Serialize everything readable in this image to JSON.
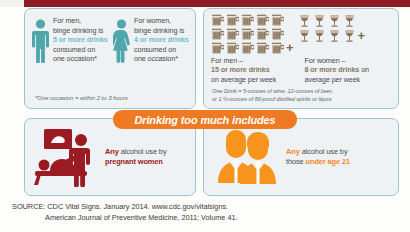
{
  "top_bar": {
    "color": "#8e1c24"
  },
  "binge_panel": {
    "men": {
      "icon": "male-figure-icon",
      "line1": "For men,",
      "line2": "binge drinking is",
      "highlight": "5 or more drinks",
      "line3": "consumed on",
      "line4": "one occasion*"
    },
    "women": {
      "icon": "female-figure-icon",
      "line1": "For women,",
      "line2": "binge drinking is",
      "highlight": "4 or more drinks",
      "line3": "consumed on",
      "line4": "one occasion*"
    },
    "footnote": "*One occasion = within 2 to 3 hours",
    "accent_color": "#4fa6ab",
    "highlight_color": "#6fc0c4"
  },
  "heavy_panel": {
    "men": {
      "icon": "beer-mug-icon",
      "icon_count": 15,
      "plus": "+",
      "line1": "For men –",
      "highlight": "15 or more drinks",
      "line2": "on average per week"
    },
    "women": {
      "icon": "wine-glass-icon",
      "icon_count": 8,
      "plus": "+",
      "line1": "For women –",
      "highlight": "8 or more drinks",
      "line2_suffix": " on",
      "line2": "average per week"
    },
    "footnote_line1": "One Drink = 5-ounces of wine, 12-ounces of beer,",
    "footnote_line2": "or 1 ½-ounces of 80-proof distilled spirits or liquor",
    "glass_color": "#8a7660"
  },
  "banner": {
    "text": "Drinking too much includes",
    "color": "#ee7b23"
  },
  "pregnant_panel": {
    "icon": "pregnant-ultrasound-icon",
    "highlight": "Any",
    "text_rest": " alcohol use by",
    "line2": "pregnant women",
    "color": "#9b1b22"
  },
  "underage_panel": {
    "icon": "two-teens-icon",
    "highlight": "Any",
    "text_rest": " alcohol use by",
    "line2_prefix": "those ",
    "line2_highlight": "under age 21",
    "color": "#f08a2b"
  },
  "source": {
    "line1": "SOURCE: CDC Vital Signs. January 2014. www.cdc.gov/vitalsigns.",
    "line2": "American Journal of Preventive Medicine, 2011; Volume 41."
  }
}
